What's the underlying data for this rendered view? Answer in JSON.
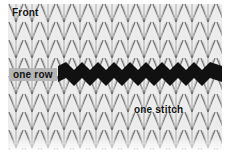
{
  "image": {
    "description": "Close-up of stockinette knit fabric with one row highlighted in black",
    "highlight_color": "#111111",
    "fabric_color": "#e8e8e8"
  },
  "labels": {
    "front": "Front",
    "one_row": "one row",
    "one_stitch": "one stitch"
  }
}
